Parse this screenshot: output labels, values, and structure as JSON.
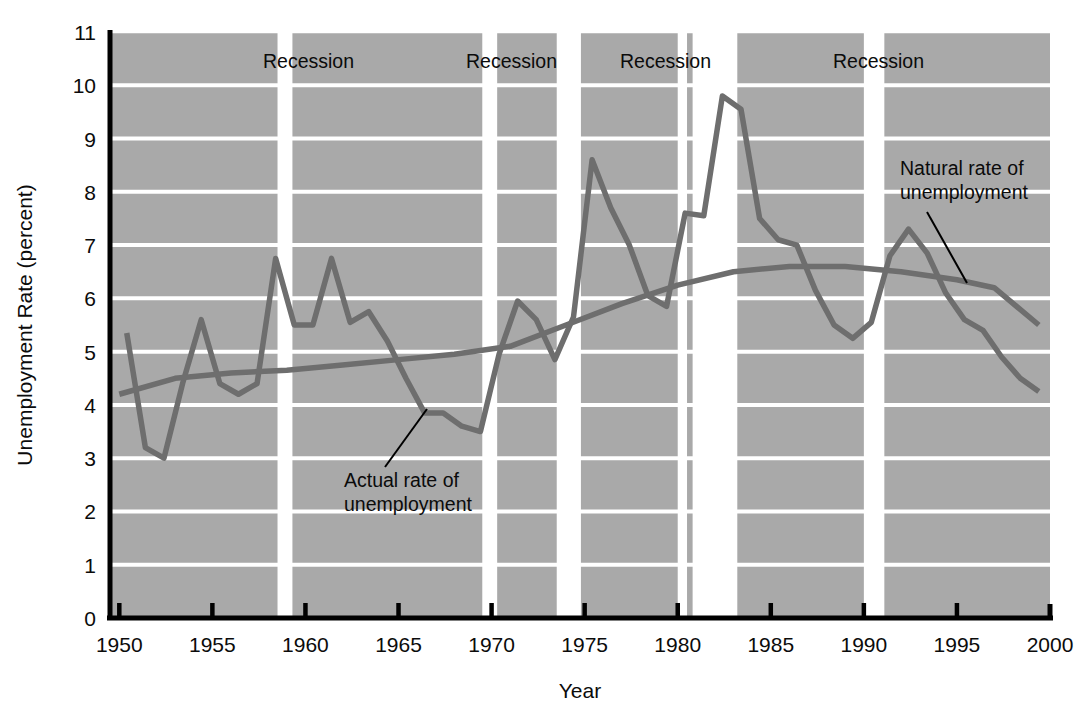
{
  "chart_data": {
    "type": "line",
    "title": "",
    "xlabel": "Year",
    "ylabel": "Unemployment Rate (percent)",
    "xlim": [
      1949.5,
      2000.0
    ],
    "ylim": [
      0,
      11
    ],
    "xticks": [
      1950,
      1955,
      1960,
      1965,
      1970,
      1975,
      1980,
      1985,
      1990,
      1995,
      2000
    ],
    "xticklabels": [
      "1950",
      "1955",
      "1960",
      "1965",
      "1970",
      "1975",
      "1980",
      "1985",
      "1990",
      "1995",
      "2000"
    ],
    "yticks": [
      0,
      1,
      2,
      3,
      4,
      5,
      6,
      7,
      8,
      9,
      10,
      11
    ],
    "yticklabels": [
      "0",
      "1",
      "2",
      "3",
      "4",
      "5",
      "6",
      "7",
      "8",
      "9",
      "10",
      "11"
    ],
    "grid": "horizontal-white-on-gray",
    "legend": "inline-annotations",
    "plot_bgcolor": "#a9a9a9",
    "gridline_color": "#ffffff",
    "line_color": "#6e6e6e",
    "axis_color": "#000000",
    "series": [
      {
        "name": "Actual rate of unemployment",
        "x": [
          1950.4,
          1951.4,
          1952.4,
          1953.4,
          1954.4,
          1955.4,
          1956.4,
          1957.4,
          1958.4,
          1959.4,
          1960.4,
          1961.4,
          1962.4,
          1963.4,
          1964.4,
          1965.4,
          1966.4,
          1967.4,
          1968.4,
          1969.4,
          1970.4,
          1971.4,
          1972.4,
          1973.4,
          1974.4,
          1975.4,
          1976.4,
          1977.4,
          1978.4,
          1979.4,
          1980.4,
          1981.4,
          1982.4,
          1983.4,
          1984.4,
          1985.4,
          1986.4,
          1987.4,
          1988.4,
          1989.4,
          1990.4,
          1991.4,
          1992.4,
          1993.4,
          1994.4,
          1995.4,
          1996.4,
          1997.4,
          1998.4,
          1999.4
        ],
        "y": [
          5.35,
          3.2,
          3.0,
          4.4,
          5.6,
          4.4,
          4.2,
          4.4,
          6.75,
          5.5,
          5.5,
          6.75,
          5.55,
          5.75,
          5.2,
          4.5,
          3.85,
          3.85,
          3.6,
          3.5,
          4.95,
          5.95,
          5.6,
          4.85,
          5.65,
          8.6,
          7.7,
          7.0,
          6.05,
          5.85,
          7.6,
          7.55,
          9.8,
          9.55,
          7.5,
          7.1,
          7.0,
          6.15,
          5.5,
          5.25,
          5.55,
          6.8,
          7.3,
          6.85,
          6.1,
          5.6,
          5.4,
          4.9,
          4.5,
          4.25
        ]
      },
      {
        "name": "Natural rate of unemployment",
        "x": [
          1950.0,
          1953.0,
          1956.0,
          1959.0,
          1962.0,
          1965.0,
          1968.0,
          1971.0,
          1974.0,
          1977.0,
          1980.0,
          1983.0,
          1986.0,
          1989.0,
          1992.0,
          1995.0,
          1997.0,
          1999.4
        ],
        "y": [
          4.2,
          4.5,
          4.6,
          4.65,
          4.75,
          4.85,
          4.95,
          5.1,
          5.5,
          5.9,
          6.25,
          6.5,
          6.6,
          6.6,
          6.5,
          6.35,
          6.2,
          5.5
        ]
      }
    ],
    "shaded_regions": [
      {
        "label": "Recession",
        "x_start": 1958.5,
        "x_end": 1959.3,
        "color": "#ffffff"
      },
      {
        "label": "Recession",
        "x_start": 1969.5,
        "x_end": 1970.3,
        "color": "#ffffff"
      },
      {
        "label": "Recession",
        "x_start": 1973.5,
        "x_end": 1974.8,
        "color": "#ffffff"
      },
      {
        "label": "Recession",
        "x_start": 1980.0,
        "x_end": 1980.5,
        "color": "#ffffff"
      },
      {
        "label": "Recession",
        "x_start": 1980.8,
        "x_end": 1983.2,
        "color": "#ffffff"
      },
      {
        "label": "Recession",
        "x_start": 1990.0,
        "x_end": 1991.1,
        "color": "#ffffff"
      }
    ],
    "region_labels": [
      {
        "text": "Recession",
        "x_px": 263,
        "y_px": 68
      },
      {
        "text": "Recession",
        "x_px": 466,
        "y_px": 68
      },
      {
        "text": "Recession",
        "x_px": 620,
        "y_px": 68
      },
      {
        "text": "Recession",
        "x_px": 833,
        "y_px": 68
      }
    ],
    "annotations": [
      {
        "text_line1": "Actual rate of",
        "text_line2": "unemployment",
        "text_x_px": 344,
        "text_y1_px": 487,
        "text_y2_px": 511,
        "leader": {
          "x1": 385,
          "y1": 467,
          "x2": 427,
          "y2": 409
        }
      },
      {
        "text_line1": "Natural rate of",
        "text_line2": "unemployment",
        "text_x_px": 900,
        "text_y1_px": 175,
        "text_y2_px": 199,
        "leader": {
          "x1": 927,
          "y1": 212,
          "x2": 967,
          "y2": 283
        }
      }
    ]
  },
  "axis": {
    "ylabel": "Unemployment Rate (percent)",
    "xlabel": "Year"
  }
}
